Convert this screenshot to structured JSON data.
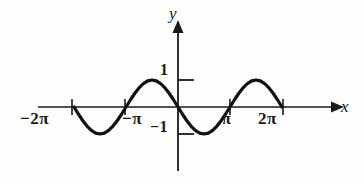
{
  "figure": {
    "background_color": "#fdfdfb",
    "ink_color": "#1a1a1a",
    "width": 363,
    "height": 185
  },
  "axes": {
    "x_label": "x",
    "y_label": "y",
    "x_axis_pixel_y": 107,
    "y_axis_pixel_x": 178
  },
  "ticks": {
    "x": [
      {
        "label": "−2π",
        "value": -6.283
      },
      {
        "label": "−π",
        "value": -3.142
      },
      {
        "label": "π",
        "value": 3.142
      },
      {
        "label": "2π",
        "value": 6.283
      }
    ],
    "y": [
      {
        "label": "1",
        "value": 1
      },
      {
        "label": "−1",
        "value": -1
      }
    ]
  },
  "chart_data": {
    "type": "line",
    "title": "",
    "xlabel": "x",
    "ylabel": "y",
    "xlim": [
      -7.5,
      8.2
    ],
    "ylim": [
      -1.6,
      1.6
    ],
    "grid": false,
    "legend": null,
    "series": [
      {
        "name": "y = −sin(x)",
        "x": [
          -6.283,
          -6.021,
          -5.76,
          -5.498,
          -5.236,
          -4.974,
          -4.712,
          -4.451,
          -4.189,
          -3.927,
          -3.665,
          -3.403,
          -3.142,
          -2.88,
          -2.618,
          -2.356,
          -2.094,
          -1.833,
          -1.571,
          -1.309,
          -1.047,
          -0.785,
          -0.524,
          -0.262,
          0,
          0.262,
          0.524,
          0.785,
          1.047,
          1.309,
          1.571,
          1.833,
          2.094,
          2.356,
          2.618,
          2.88,
          3.142,
          3.403,
          3.665,
          3.927,
          4.189,
          4.451,
          4.712,
          4.974,
          5.236,
          5.498,
          5.76,
          6.021,
          6.283
        ],
        "y": [
          0,
          -0.259,
          -0.5,
          -0.707,
          -0.866,
          -0.966,
          -1,
          -0.966,
          -0.866,
          -0.707,
          -0.5,
          -0.259,
          0,
          0.259,
          0.5,
          0.707,
          0.866,
          0.966,
          1,
          0.966,
          0.866,
          0.707,
          0.5,
          0.259,
          0,
          -0.259,
          -0.5,
          -0.707,
          -0.866,
          -0.966,
          -1,
          -0.966,
          -0.866,
          -0.707,
          -0.5,
          -0.259,
          0,
          0.259,
          0.5,
          0.707,
          0.866,
          0.966,
          1,
          0.966,
          0.866,
          0.707,
          0.5,
          0.259,
          0
        ],
        "amplitude": 1,
        "period": 6.283,
        "domain_start": -6.283,
        "domain_end": 6.283,
        "color": "#111111",
        "line_width": 3.2
      }
    ],
    "annotations": []
  }
}
